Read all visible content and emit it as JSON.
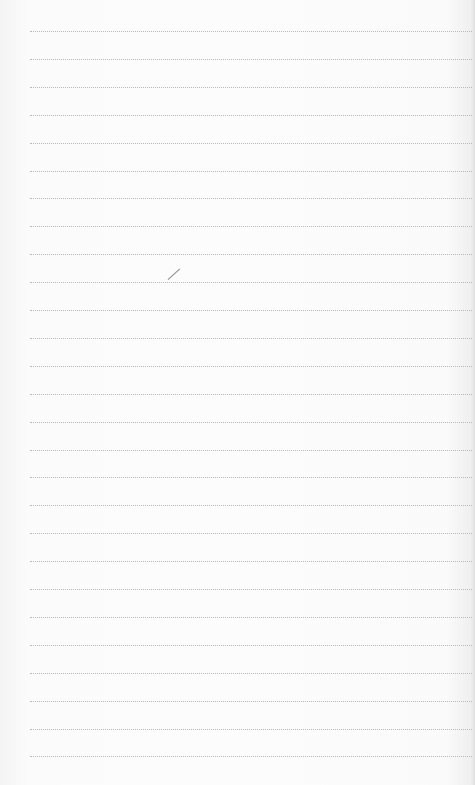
{
  "page": {
    "type": "ruled notepad page",
    "background_color": "#fcfcfc",
    "rule_color": "#b9b9b9",
    "rule_style": "dotted",
    "rule_count": 27,
    "rule_start_y": 31,
    "rule_spacing": 27.9,
    "pen_mark": {
      "x": 168,
      "y": 279,
      "length": 16,
      "angle_deg": -42
    }
  }
}
